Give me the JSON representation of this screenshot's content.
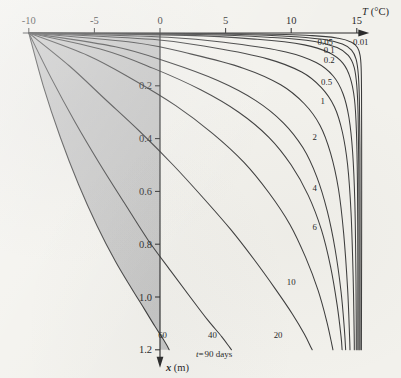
{
  "figure": {
    "caption_note": "t = 90 days",
    "x_axis": {
      "label_symbol": "T",
      "label_unit": "(°C)",
      "ticks": [
        -10,
        -5,
        0,
        5,
        10,
        15
      ],
      "tick_labels": [
        "-10",
        "-5",
        "0",
        "5",
        "10",
        "15"
      ],
      "range": [
        -10,
        15.8
      ],
      "arrow": true
    },
    "y_axis": {
      "label_symbol": "x",
      "label_unit": "(m)",
      "ticks": [
        0.2,
        0.4,
        0.6,
        0.8,
        1.0,
        1.2
      ],
      "tick_labels": [
        "0.2",
        "0.4",
        "0.6",
        "0.8",
        "1.0",
        "1.2"
      ],
      "range": [
        0,
        1.2
      ],
      "position_at_T": 0,
      "direction": "downward",
      "arrow": true
    },
    "time_note": {
      "prefix": "t",
      "equals": "=",
      "value": "90 days"
    }
  },
  "chart_data": {
    "type": "line",
    "title": "",
    "xlabel": "T (°C)",
    "ylabel": "x (m)",
    "xlim": [
      -10,
      15.8
    ],
    "ylim": [
      0,
      1.2
    ],
    "y_inverted": true,
    "grid": false,
    "legend": "inline-curve-labels",
    "annotations": [
      "t = 90 days"
    ],
    "shaded_region": {
      "description": "gray fill between the 60-day curve and the T = 0 axis",
      "left_boundary_curve": "60",
      "right_boundary": "T = 0 axis"
    },
    "curve_label_name": "days",
    "series": [
      {
        "name": "0.01",
        "label": "0.01",
        "label_pos": {
          "T": 15.3,
          "x": 0.045
        },
        "points": [
          [
            -10,
            0.0
          ],
          [
            6.2,
            0.003
          ],
          [
            11.6,
            0.01
          ],
          [
            13.6,
            0.02
          ],
          [
            14.6,
            0.035
          ],
          [
            15.05,
            0.055
          ],
          [
            15.25,
            0.085
          ],
          [
            15.33,
            0.13
          ],
          [
            15.36,
            0.22
          ],
          [
            15.37,
            0.4
          ],
          [
            15.37,
            0.7
          ],
          [
            15.36,
            1.0
          ],
          [
            15.35,
            1.2
          ]
        ]
      },
      {
        "name": "0.05",
        "label": "0.05",
        "label_pos": {
          "T": 12.6,
          "x": 0.045
        },
        "points": [
          [
            -10,
            0.0
          ],
          [
            4.0,
            0.004
          ],
          [
            9.6,
            0.012
          ],
          [
            12.4,
            0.024
          ],
          [
            13.9,
            0.042
          ],
          [
            14.6,
            0.065
          ],
          [
            14.95,
            0.1
          ],
          [
            15.12,
            0.16
          ],
          [
            15.2,
            0.26
          ],
          [
            15.24,
            0.44
          ],
          [
            15.25,
            0.72
          ],
          [
            15.25,
            1.0
          ],
          [
            15.25,
            1.2
          ]
        ]
      },
      {
        "name": "0.1",
        "label": "0.1",
        "label_pos": {
          "T": 12.9,
          "x": 0.075
        },
        "points": [
          [
            -10,
            0.0
          ],
          [
            3.0,
            0.006
          ],
          [
            8.6,
            0.017
          ],
          [
            11.8,
            0.032
          ],
          [
            13.5,
            0.055
          ],
          [
            14.35,
            0.085
          ],
          [
            14.8,
            0.13
          ],
          [
            15.0,
            0.2
          ],
          [
            15.1,
            0.31
          ],
          [
            15.15,
            0.5
          ],
          [
            15.17,
            0.78
          ],
          [
            15.17,
            1.05
          ],
          [
            15.17,
            1.2
          ]
        ]
      },
      {
        "name": "0.2",
        "label": "0.2",
        "label_pos": {
          "T": 12.9,
          "x": 0.115
        },
        "points": [
          [
            -10,
            0.0
          ],
          [
            2.0,
            0.009
          ],
          [
            7.4,
            0.024
          ],
          [
            11.0,
            0.045
          ],
          [
            12.9,
            0.075
          ],
          [
            13.95,
            0.115
          ],
          [
            14.5,
            0.17
          ],
          [
            14.82,
            0.25
          ],
          [
            14.97,
            0.37
          ],
          [
            15.05,
            0.57
          ],
          [
            15.08,
            0.85
          ],
          [
            15.08,
            1.1
          ],
          [
            15.08,
            1.2
          ]
        ]
      },
      {
        "name": "0.5",
        "label": "0.5",
        "label_pos": {
          "T": 12.7,
          "x": 0.196
        },
        "points": [
          [
            -10,
            0.0
          ],
          [
            0.6,
            0.016
          ],
          [
            5.6,
            0.04
          ],
          [
            9.6,
            0.072
          ],
          [
            11.9,
            0.112
          ],
          [
            13.2,
            0.163
          ],
          [
            13.95,
            0.23
          ],
          [
            14.4,
            0.32
          ],
          [
            14.68,
            0.45
          ],
          [
            14.85,
            0.64
          ],
          [
            14.93,
            0.9
          ],
          [
            14.96,
            1.12
          ],
          [
            14.96,
            1.2
          ]
        ]
      },
      {
        "name": "1",
        "label": "1",
        "label_pos": {
          "T": 12.4,
          "x": 0.268
        },
        "points": [
          [
            -10,
            0.0
          ],
          [
            -0.6,
            0.024
          ],
          [
            4.1,
            0.056
          ],
          [
            8.2,
            0.098
          ],
          [
            10.8,
            0.148
          ],
          [
            12.3,
            0.207
          ],
          [
            13.3,
            0.28
          ],
          [
            13.9,
            0.375
          ],
          [
            14.3,
            0.5
          ],
          [
            14.56,
            0.68
          ],
          [
            14.72,
            0.92
          ],
          [
            14.8,
            1.14
          ],
          [
            14.81,
            1.2
          ]
        ]
      },
      {
        "name": "2",
        "label": "2",
        "label_pos": {
          "T": 11.8,
          "x": 0.405
        },
        "points": [
          [
            -10,
            0.0
          ],
          [
            -2.0,
            0.036
          ],
          [
            2.4,
            0.08
          ],
          [
            6.4,
            0.134
          ],
          [
            9.2,
            0.196
          ],
          [
            11.0,
            0.268
          ],
          [
            12.2,
            0.35
          ],
          [
            13.0,
            0.455
          ],
          [
            13.6,
            0.59
          ],
          [
            14.0,
            0.76
          ],
          [
            14.3,
            0.97
          ],
          [
            14.45,
            1.15
          ],
          [
            14.48,
            1.2
          ]
        ]
      },
      {
        "name": "4",
        "label": "4",
        "label_pos": {
          "T": 11.8,
          "x": 0.6
        },
        "points": [
          [
            -10,
            0.0
          ],
          [
            -3.4,
            0.052
          ],
          [
            0.6,
            0.11
          ],
          [
            4.4,
            0.18
          ],
          [
            7.3,
            0.256
          ],
          [
            9.4,
            0.34
          ],
          [
            10.9,
            0.435
          ],
          [
            11.95,
            0.545
          ],
          [
            12.75,
            0.675
          ],
          [
            13.35,
            0.82
          ],
          [
            13.8,
            0.98
          ],
          [
            14.05,
            1.12
          ],
          [
            14.15,
            1.2
          ]
        ]
      },
      {
        "name": "6",
        "label": "6",
        "label_pos": {
          "T": 11.8,
          "x": 0.745
        },
        "points": [
          [
            -10,
            0.0
          ],
          [
            -4.3,
            0.064
          ],
          [
            -0.5,
            0.134
          ],
          [
            3.1,
            0.215
          ],
          [
            6.0,
            0.3
          ],
          [
            8.3,
            0.395
          ],
          [
            10.0,
            0.5
          ],
          [
            11.3,
            0.615
          ],
          [
            12.3,
            0.745
          ],
          [
            13.0,
            0.885
          ],
          [
            13.5,
            1.03
          ],
          [
            13.8,
            1.15
          ],
          [
            13.88,
            1.2
          ]
        ]
      },
      {
        "name": "10",
        "label": "10",
        "label_pos": {
          "T": 10.0,
          "x": 0.955
        },
        "points": [
          [
            -10,
            0.0
          ],
          [
            -5.5,
            0.085
          ],
          [
            -2.1,
            0.175
          ],
          [
            1.2,
            0.275
          ],
          [
            4.0,
            0.38
          ],
          [
            6.4,
            0.49
          ],
          [
            8.3,
            0.605
          ],
          [
            9.9,
            0.725
          ],
          [
            11.1,
            0.85
          ],
          [
            12.05,
            0.975
          ],
          [
            12.7,
            1.09
          ],
          [
            13.1,
            1.18
          ],
          [
            13.18,
            1.2
          ]
        ]
      },
      {
        "name": "20",
        "label": "20",
        "label_pos": {
          "T": 9.0,
          "x": 1.155
        },
        "points": [
          [
            -10,
            0.0
          ],
          [
            -6.9,
            0.125
          ],
          [
            -4.2,
            0.25
          ],
          [
            -1.5,
            0.375
          ],
          [
            1.0,
            0.5
          ],
          [
            3.3,
            0.625
          ],
          [
            5.4,
            0.745
          ],
          [
            7.2,
            0.86
          ],
          [
            8.8,
            0.97
          ],
          [
            10.1,
            1.065
          ],
          [
            11.0,
            1.14
          ],
          [
            11.5,
            1.19
          ],
          [
            11.6,
            1.2
          ]
        ]
      },
      {
        "name": "40",
        "label": "40",
        "label_pos": {
          "T": 4.0,
          "x": 1.155
        },
        "points": [
          [
            -10,
            0.0
          ],
          [
            -8.3,
            0.17
          ],
          [
            -6.5,
            0.335
          ],
          [
            -4.6,
            0.495
          ],
          [
            -2.7,
            0.645
          ],
          [
            -0.9,
            0.785
          ],
          [
            0.8,
            0.9
          ],
          [
            2.3,
            1.0
          ],
          [
            3.6,
            1.085
          ],
          [
            4.7,
            1.15
          ],
          [
            5.3,
            1.19
          ],
          [
            5.45,
            1.2
          ]
        ]
      },
      {
        "name": "60",
        "label": "60",
        "label_pos": {
          "T": 0.2,
          "x": 1.155
        },
        "points": [
          [
            -10,
            0.0
          ],
          [
            -8.9,
            0.2
          ],
          [
            -7.6,
            0.395
          ],
          [
            -6.2,
            0.575
          ],
          [
            -4.8,
            0.73
          ],
          [
            -3.4,
            0.865
          ],
          [
            -2.2,
            0.965
          ],
          [
            -1.2,
            1.045
          ],
          [
            -0.4,
            1.11
          ],
          [
            0.25,
            1.16
          ],
          [
            0.6,
            1.19
          ],
          [
            0.7,
            1.2
          ]
        ]
      }
    ]
  }
}
